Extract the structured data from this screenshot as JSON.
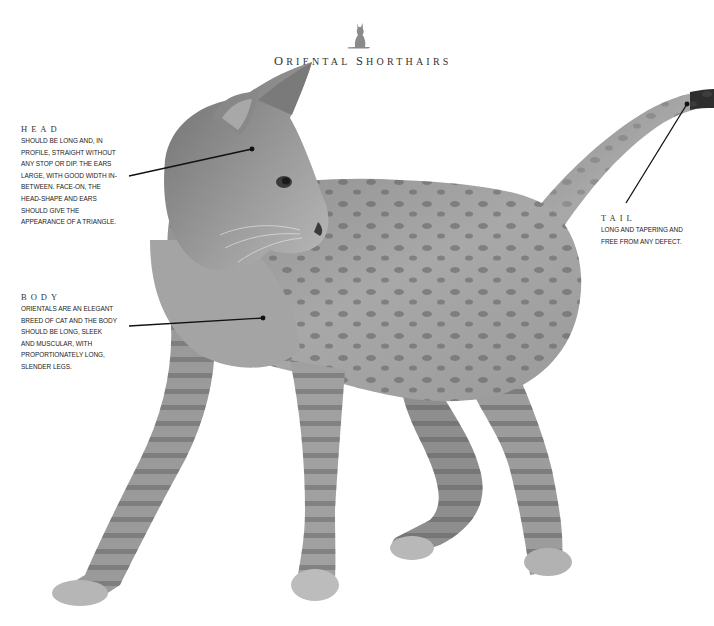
{
  "header": {
    "logo_icon": "sitting-cat-silhouette-icon",
    "title_parts": [
      {
        "big": "O",
        "rest": "RIENTAL "
      },
      {
        "big": "S",
        "rest": "HORTHAIRS"
      }
    ],
    "title": "Oriental Shorthairs"
  },
  "annotations": {
    "head": {
      "label": "HEAD",
      "text": "SHOULD BE LONG AND, IN\nPROFILE, STRAIGHT WITHOUT\nANY STOP OR DIP. THE EARS\nLARGE, WITH GOOD WIDTH IN-\nBETWEEN. FACE-ON, THE\nHEAD-SHAPE AND EARS\nSHOULD GIVE THE\nAPPEARANCE OF A TRIANGLE."
    },
    "body": {
      "label": "BODY",
      "text": "ORIENTALS ARE AN ELEGANT\nBREED OF CAT AND THE BODY\nSHOULD BE LONG, SLEEK\nAND MUSCULAR, WITH\nPROPORTIONATELY LONG,\nSLENDER LEGS."
    },
    "tail": {
      "label": "TAIL",
      "text": "LONG AND TAPERING AND\nFREE FROM ANY DEFECT."
    }
  },
  "image": {
    "subject": "spotted-tabby-oriental-shorthair-cat-photo",
    "palette": {
      "fur_light": "#b4b4b4",
      "fur_mid": "#8a8a8a",
      "fur_dark": "#4a4a4a",
      "line": "#111111"
    }
  }
}
